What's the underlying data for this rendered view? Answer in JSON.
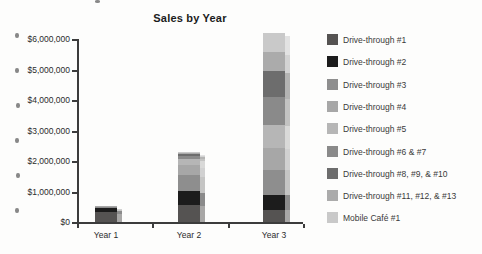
{
  "chart_data": {
    "type": "bar",
    "stacked": true,
    "title": "Sales by Year",
    "categories": [
      "Year 1",
      "Year 2",
      "Year 3"
    ],
    "series": [
      {
        "name": "Drive-through #1",
        "color": "#555352",
        "values": [
          320000,
          550000,
          400000
        ]
      },
      {
        "name": "Drive-through #2",
        "color": "#1c1c1c",
        "values": [
          130000,
          460000,
          500000
        ]
      },
      {
        "name": "Drive-through #3",
        "color": "#8e8e8e",
        "values": [
          40000,
          520000,
          820000
        ]
      },
      {
        "name": "Drive-through #4",
        "color": "#a7a7a7",
        "values": [
          30000,
          330000,
          720000
        ]
      },
      {
        "name": "Drive-through #5",
        "color": "#b6b6b6",
        "values": [
          0,
          220000,
          750000
        ]
      },
      {
        "name": "Drive-through #6 & #7",
        "color": "#8a8a8a",
        "values": [
          0,
          80000,
          920000
        ]
      },
      {
        "name": "Drive-through #8, #9, & #10",
        "color": "#6d6d6d",
        "values": [
          0,
          70000,
          850000
        ]
      },
      {
        "name": "Drive-through #11, #12, & #13",
        "color": "#ababab",
        "values": [
          0,
          40000,
          620000
        ]
      },
      {
        "name": "Mobile Café #1",
        "color": "#c9c9c9",
        "values": [
          0,
          30000,
          620000
        ]
      }
    ],
    "category_totals": [
      520000,
      2300000,
      6200000
    ],
    "y_ticks": [
      "$0",
      "$1,000,000",
      "$2,000,000",
      "$3,000,000",
      "$4,000,000",
      "$5,000,000",
      "$6,000,000"
    ],
    "xlabel": "",
    "ylabel": "",
    "ylim": [
      0,
      6000000
    ],
    "grid": false,
    "legend_position": "right"
  }
}
